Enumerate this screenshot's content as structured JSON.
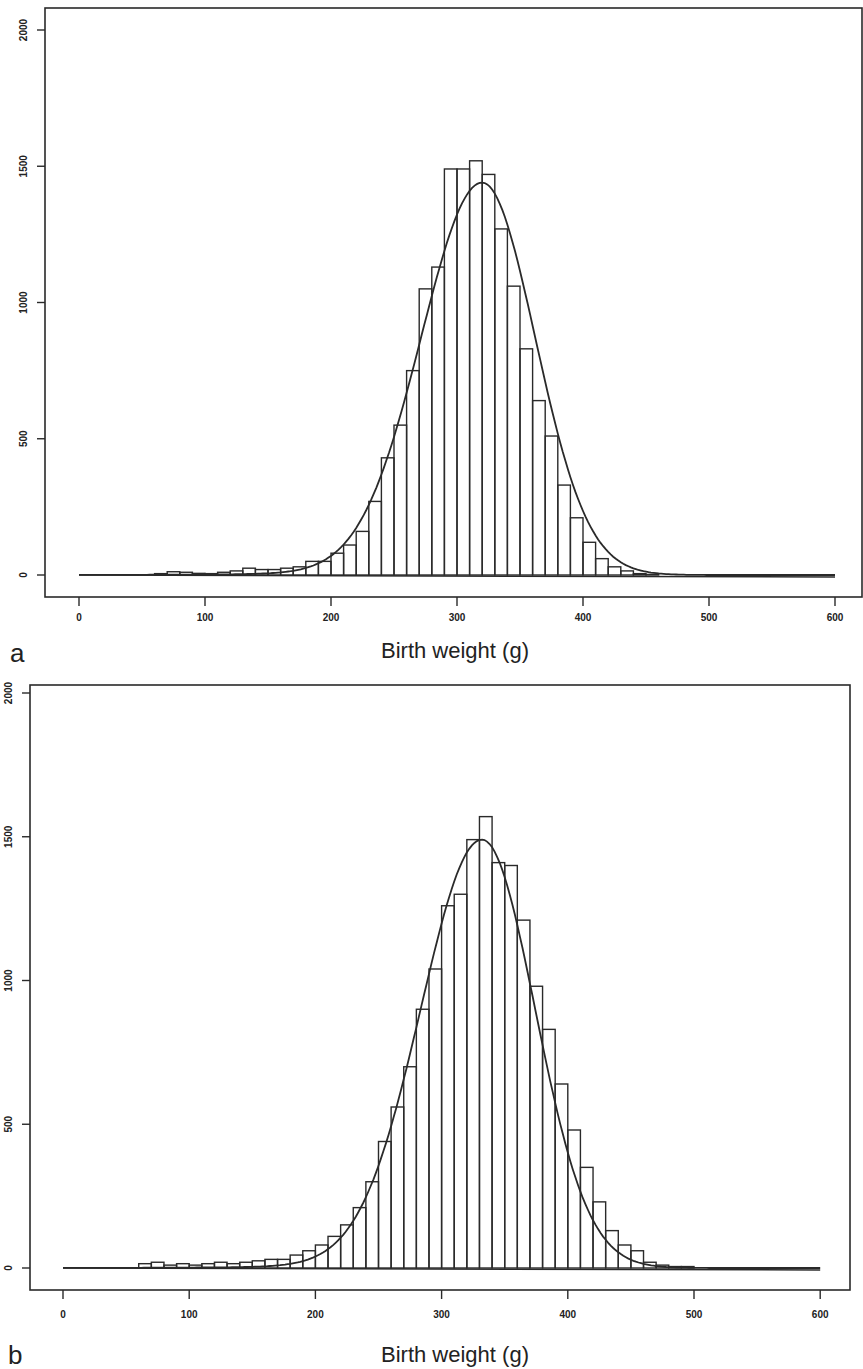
{
  "chart_data": [
    {
      "panel": "a",
      "type": "bar",
      "subtype": "histogram_with_fitted_curve",
      "title": "",
      "xlabel": "Birth weight (g)",
      "ylabel": "",
      "xlim": [
        0,
        600
      ],
      "ylim": [
        0,
        2000
      ],
      "xticks": [
        0,
        100,
        200,
        300,
        400,
        500,
        600
      ],
      "yticks": [
        0,
        500,
        1000,
        1500,
        2000
      ],
      "grid": false,
      "bin_width": 10,
      "bin_starts": [
        60,
        70,
        80,
        90,
        100,
        110,
        120,
        130,
        140,
        150,
        160,
        170,
        180,
        190,
        200,
        210,
        220,
        230,
        240,
        250,
        260,
        270,
        280,
        290,
        300,
        310,
        320,
        330,
        340,
        350,
        360,
        370,
        380,
        390,
        400,
        410,
        420,
        430,
        440,
        450
      ],
      "values": [
        5,
        12,
        10,
        6,
        5,
        10,
        15,
        25,
        20,
        20,
        25,
        30,
        50,
        50,
        80,
        110,
        160,
        270,
        430,
        550,
        750,
        1050,
        1130,
        1490,
        1490,
        1520,
        1470,
        1270,
        1060,
        830,
        640,
        510,
        330,
        210,
        120,
        60,
        30,
        15,
        5,
        2
      ],
      "curve": {
        "type": "normal",
        "mean": 320,
        "peak": 1440,
        "x_range": [
          0,
          600
        ]
      }
    },
    {
      "panel": "b",
      "type": "bar",
      "subtype": "histogram_with_fitted_curve",
      "title": "",
      "xlabel": "Birth weight (g)",
      "ylabel": "",
      "xlim": [
        0,
        600
      ],
      "ylim": [
        0,
        2000
      ],
      "xticks": [
        0,
        100,
        200,
        300,
        400,
        500,
        600
      ],
      "yticks": [
        0,
        500,
        1000,
        1500,
        2000
      ],
      "grid": false,
      "bin_width": 10,
      "bin_starts": [
        60,
        70,
        80,
        90,
        100,
        110,
        120,
        130,
        140,
        150,
        160,
        170,
        180,
        190,
        200,
        210,
        220,
        230,
        240,
        250,
        260,
        270,
        280,
        290,
        300,
        310,
        320,
        330,
        340,
        350,
        360,
        370,
        380,
        390,
        400,
        410,
        420,
        430,
        440,
        450,
        460,
        470,
        480,
        490
      ],
      "values": [
        15,
        20,
        10,
        15,
        10,
        15,
        20,
        15,
        20,
        25,
        30,
        30,
        45,
        60,
        80,
        110,
        150,
        210,
        300,
        440,
        560,
        700,
        900,
        1040,
        1260,
        1300,
        1490,
        1570,
        1410,
        1400,
        1210,
        980,
        830,
        640,
        480,
        350,
        230,
        130,
        80,
        60,
        20,
        10,
        5,
        5
      ],
      "curve": {
        "type": "normal",
        "mean": 332,
        "peak": 1490,
        "x_range": [
          0,
          600
        ]
      }
    }
  ],
  "panels": [
    {
      "label": "a",
      "xlabel": "Birth weight (g)",
      "xtick_labels": [
        "0",
        "100",
        "200",
        "300",
        "400",
        "500",
        "600"
      ],
      "ytick_labels": [
        "0",
        "500",
        "1000",
        "1500",
        "2000"
      ]
    },
    {
      "label": "b",
      "xlabel": "Birth weight (g)",
      "xtick_labels": [
        "0",
        "100",
        "200",
        "300",
        "400",
        "500",
        "600"
      ],
      "ytick_labels": [
        "0",
        "500",
        "1000",
        "1500",
        "2000"
      ]
    }
  ],
  "style": {
    "stroke": "#2a2a2a",
    "background": "#ffffff"
  }
}
